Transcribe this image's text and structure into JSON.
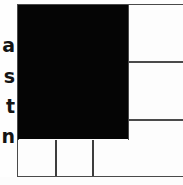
{
  "figure": {
    "kind": "scanned-table-fragment",
    "width": 183,
    "height": 185,
    "background_color": "#fefefe",
    "rule_color": "#4a4a4a",
    "filled_cell_color": "#050505",
    "empty_cell_color": "#fdfdfd"
  },
  "row_labels": [
    {
      "text": "a"
    },
    {
      "text": "s"
    },
    {
      "text": "t"
    },
    {
      "text": "n"
    }
  ],
  "grid": {
    "filled_block": {
      "label": ""
    },
    "right_column": [
      {
        "label": ""
      },
      {
        "label": ""
      },
      {
        "label": ""
      }
    ],
    "bottom_row": [
      {
        "label": ""
      },
      {
        "label": ""
      },
      {
        "label": ""
      }
    ]
  }
}
